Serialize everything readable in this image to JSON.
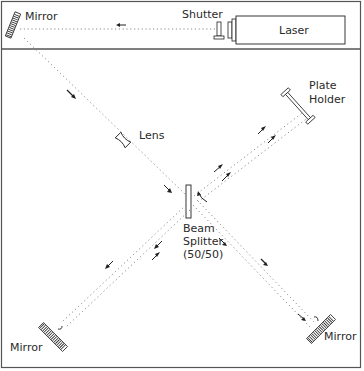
{
  "labels": {
    "mirror_top": "Mirror",
    "shutter": "Shutter",
    "laser": "Laser",
    "plate_holder_line1": "Plate",
    "plate_holder_line2": "Holder",
    "lens": "Lens",
    "beam_splitter_line1": "Beam",
    "beam_splitter_line2": "Splitter",
    "beam_splitter_line3": "(50/50)",
    "mirror_bottom_left": "Mirror",
    "mirror_bottom_right": "Mirror"
  },
  "components": [
    "Laser",
    "Shutter",
    "Mirror",
    "Lens",
    "Beam Splitter (50/50)",
    "Plate Holder",
    "Mirror",
    "Mirror"
  ],
  "colors": {
    "line": "#3a3a3a",
    "beam": "#8a8a8a",
    "border": "#555555"
  }
}
